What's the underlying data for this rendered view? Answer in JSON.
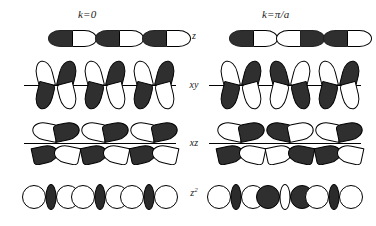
{
  "figure": {
    "caption_none": "",
    "columns": [
      {
        "id": "k0",
        "label": "k=0"
      },
      {
        "id": "kpia",
        "label": "k=π/a"
      }
    ],
    "rows": [
      {
        "id": "z",
        "label": "z",
        "orbital_type": "p"
      },
      {
        "id": "xy",
        "label": "xy",
        "orbital_type": "d"
      },
      {
        "id": "xz",
        "label": "xz",
        "orbital_type": "d"
      },
      {
        "id": "z2",
        "label": "z²",
        "orbital_type": "d"
      }
    ],
    "colors": {
      "filled_lobe": "#2f2f2f",
      "empty_lobe": "#ffffff",
      "outline": "#000000",
      "axis_line": "#000000",
      "background": "#ffffff"
    },
    "cells": [
      {
        "row": "z",
        "column": "k0",
        "repeat_units": 3,
        "pattern": "in-phase",
        "units": [
          {
            "left_lobe": "dark",
            "right_lobe": "light"
          },
          {
            "left_lobe": "dark",
            "right_lobe": "light"
          },
          {
            "left_lobe": "dark",
            "right_lobe": "light"
          }
        ]
      },
      {
        "row": "z",
        "column": "kpia",
        "repeat_units": 3,
        "pattern": "alternating",
        "units": [
          {
            "left_lobe": "dark",
            "right_lobe": "light"
          },
          {
            "left_lobe": "light",
            "right_lobe": "dark"
          },
          {
            "left_lobe": "dark",
            "right_lobe": "light"
          }
        ]
      },
      {
        "row": "xy",
        "column": "k0",
        "repeat_units": 3,
        "pattern": "in-phase",
        "axis_line": true,
        "units": [
          {
            "upper_left": "light",
            "upper_right": "dark",
            "lower_left": "dark",
            "lower_right": "light"
          },
          {
            "upper_left": "light",
            "upper_right": "dark",
            "lower_left": "dark",
            "lower_right": "light"
          },
          {
            "upper_left": "light",
            "upper_right": "dark",
            "lower_left": "dark",
            "lower_right": "light"
          }
        ]
      },
      {
        "row": "xy",
        "column": "kpia",
        "repeat_units": 3,
        "pattern": "alternating",
        "axis_line": true,
        "units": [
          {
            "upper_left": "light",
            "upper_right": "dark",
            "lower_left": "dark",
            "lower_right": "light"
          },
          {
            "upper_left": "dark",
            "upper_right": "light",
            "lower_left": "light",
            "lower_right": "dark"
          },
          {
            "upper_left": "light",
            "upper_right": "dark",
            "lower_left": "dark",
            "lower_right": "light"
          }
        ]
      },
      {
        "row": "xz",
        "column": "k0",
        "repeat_units": 3,
        "pattern": "in-phase",
        "axis_line": true,
        "units": [
          {
            "upper_left": "light",
            "upper_right": "dark",
            "lower_left": "dark",
            "lower_right": "light"
          },
          {
            "upper_left": "light",
            "upper_right": "dark",
            "lower_left": "dark",
            "lower_right": "light"
          },
          {
            "upper_left": "light",
            "upper_right": "dark",
            "lower_left": "dark",
            "lower_right": "light"
          }
        ]
      },
      {
        "row": "xz",
        "column": "kpia",
        "repeat_units": 3,
        "pattern": "alternating",
        "axis_line": true,
        "units": [
          {
            "upper_left": "light",
            "upper_right": "dark",
            "lower_left": "dark",
            "lower_right": "light"
          },
          {
            "upper_left": "dark",
            "upper_right": "light",
            "lower_left": "light",
            "lower_right": "dark"
          },
          {
            "upper_left": "light",
            "upper_right": "dark",
            "lower_left": "dark",
            "lower_right": "light"
          }
        ]
      },
      {
        "row": "z2",
        "column": "k0",
        "repeat_units": 3,
        "pattern": "in-phase",
        "units": [
          {
            "left_lobe": "light",
            "right_lobe": "light",
            "ring": "dark"
          },
          {
            "left_lobe": "light",
            "right_lobe": "light",
            "ring": "dark"
          },
          {
            "left_lobe": "light",
            "right_lobe": "light",
            "ring": "dark"
          }
        ]
      },
      {
        "row": "z2",
        "column": "kpia",
        "repeat_units": 3,
        "pattern": "alternating",
        "units": [
          {
            "left_lobe": "light",
            "right_lobe": "light",
            "ring": "dark"
          },
          {
            "left_lobe": "dark",
            "right_lobe": "dark",
            "ring": "light"
          },
          {
            "left_lobe": "light",
            "right_lobe": "light",
            "ring": "dark"
          }
        ]
      }
    ]
  }
}
